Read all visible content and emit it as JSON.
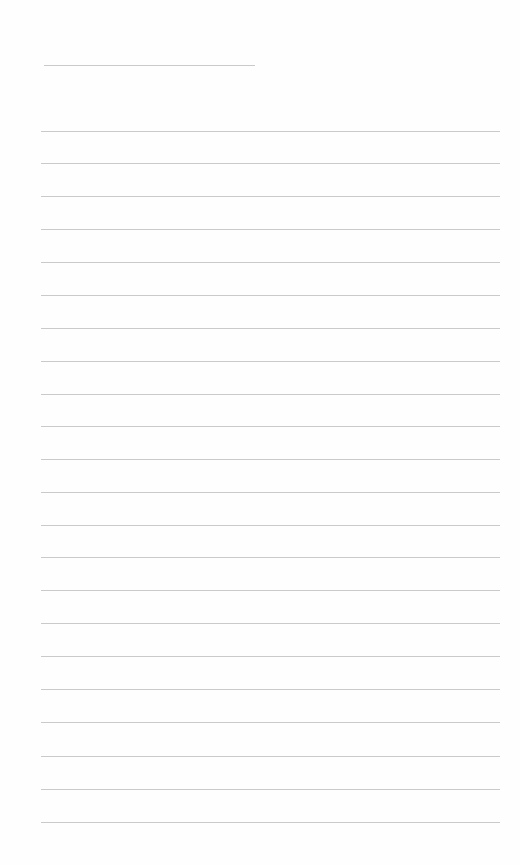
{
  "page": {
    "type": "lined-paper",
    "background_color": "#fefefe",
    "line_color": "#cacaca",
    "title_line": {
      "x": 44,
      "y": 65,
      "width": 211
    },
    "ruled_lines": {
      "count": 22,
      "x": 41,
      "width": 459,
      "positions_y": [
        131,
        163,
        196,
        229,
        262,
        295,
        328,
        361,
        394,
        426,
        459,
        492,
        525,
        557,
        590,
        623,
        656,
        689,
        722,
        756,
        789,
        822
      ]
    }
  }
}
